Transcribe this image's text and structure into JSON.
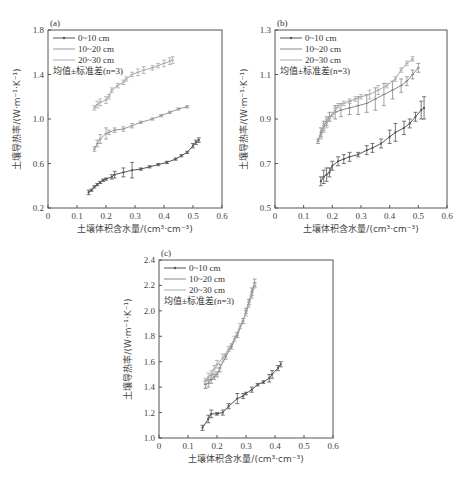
{
  "chart_data": [
    {
      "panel": "(a)",
      "type": "line",
      "title": "",
      "xlabel": "土壤体积含水量/(cm³·cm⁻³)",
      "ylabel": "土壤导热率/(W·m⁻¹·K⁻¹)",
      "xlim": [
        0,
        0.6
      ],
      "ylim": [
        0.2,
        1.8
      ],
      "xticks": [
        "0",
        "0.1",
        "0.2",
        "0.3",
        "0.4",
        "0.5",
        "0.6"
      ],
      "yticks": [
        "0.2",
        "0.6",
        "1.0",
        "1.4",
        "1.8"
      ],
      "legend": [
        "0~10 cm",
        "10~20 cm",
        "20~30 cm",
        "均值±标准差(n=3)"
      ],
      "legend_position": "upper left",
      "grid": false,
      "series": [
        {
          "name": "0~10 cm",
          "color": "#555555",
          "marker": "dot",
          "x": [
            0.14,
            0.15,
            0.16,
            0.17,
            0.18,
            0.19,
            0.2,
            0.22,
            0.23,
            0.26,
            0.29,
            0.32,
            0.35,
            0.38,
            0.41,
            0.44,
            0.46,
            0.48,
            0.5,
            0.51,
            0.52
          ],
          "y": [
            0.34,
            0.36,
            0.39,
            0.41,
            0.43,
            0.45,
            0.46,
            0.48,
            0.5,
            0.52,
            0.54,
            0.55,
            0.57,
            0.59,
            0.61,
            0.64,
            0.67,
            0.7,
            0.76,
            0.79,
            0.81
          ],
          "err": [
            0.02,
            0.01,
            0.01,
            0.01,
            0.01,
            0.01,
            0.01,
            0.02,
            0.03,
            0.04,
            0.07,
            0.01,
            0.01,
            0.01,
            0.01,
            0.01,
            0.01,
            0.01,
            0.02,
            0.02,
            0.02
          ]
        },
        {
          "name": "10~20 cm",
          "color": "#999999",
          "marker": "tick",
          "x": [
            0.16,
            0.17,
            0.18,
            0.2,
            0.21,
            0.23,
            0.26,
            0.29,
            0.32,
            0.36,
            0.39,
            0.42,
            0.45,
            0.48
          ],
          "y": [
            0.73,
            0.78,
            0.82,
            0.87,
            0.88,
            0.9,
            0.91,
            0.94,
            0.97,
            1.0,
            1.03,
            1.06,
            1.09,
            1.11
          ],
          "err": [
            0.02,
            0.03,
            0.04,
            0.05,
            0.02,
            0.02,
            0.02,
            0.02,
            0.01,
            0.01,
            0.01,
            0.01,
            0.01,
            0.01
          ]
        },
        {
          "name": "20~30 cm",
          "color": "#aaaaaa",
          "marker": "tick",
          "x": [
            0.16,
            0.17,
            0.18,
            0.2,
            0.21,
            0.22,
            0.24,
            0.26,
            0.27,
            0.29,
            0.31,
            0.33,
            0.36,
            0.38,
            0.4,
            0.42,
            0.43
          ],
          "y": [
            1.1,
            1.13,
            1.15,
            1.17,
            1.2,
            1.26,
            1.3,
            1.33,
            1.36,
            1.4,
            1.42,
            1.44,
            1.46,
            1.48,
            1.5,
            1.52,
            1.53
          ],
          "err": [
            0.02,
            0.03,
            0.03,
            0.03,
            0.02,
            0.02,
            0.02,
            0.02,
            0.02,
            0.02,
            0.03,
            0.03,
            0.02,
            0.02,
            0.03,
            0.03,
            0.03
          ]
        }
      ]
    },
    {
      "panel": "(b)",
      "type": "line",
      "title": "",
      "xlabel": "土壤体积含水量/(cm³·cm⁻³)",
      "ylabel": "土壤导热率/(W·m⁻¹·K⁻¹)",
      "xlim": [
        0,
        0.6
      ],
      "ylim": [
        0.5,
        1.3
      ],
      "xticks": [
        "0",
        "0.1",
        "0.2",
        "0.3",
        "0.4",
        "0.5",
        "0.6"
      ],
      "yticks": [
        "0.5",
        "0.7",
        "0.9",
        "1.1",
        "1.3"
      ],
      "legend": [
        "0~10 cm",
        "10~20 cm",
        "20~30 cm",
        "均值±标准差(n=3)"
      ],
      "legend_position": "upper left",
      "grid": false,
      "series": [
        {
          "name": "0~10 cm",
          "color": "#555555",
          "marker": "dot",
          "x": [
            0.16,
            0.17,
            0.18,
            0.19,
            0.2,
            0.22,
            0.24,
            0.26,
            0.29,
            0.32,
            0.34,
            0.37,
            0.4,
            0.42,
            0.45,
            0.47,
            0.49,
            0.51,
            0.52
          ],
          "y": [
            0.62,
            0.64,
            0.65,
            0.66,
            0.69,
            0.71,
            0.72,
            0.73,
            0.74,
            0.76,
            0.77,
            0.79,
            0.82,
            0.84,
            0.86,
            0.88,
            0.91,
            0.94,
            0.95
          ],
          "err": [
            0.02,
            0.03,
            0.03,
            0.02,
            0.02,
            0.02,
            0.02,
            0.02,
            0.01,
            0.02,
            0.02,
            0.02,
            0.03,
            0.04,
            0.03,
            0.02,
            0.02,
            0.04,
            0.05
          ]
        },
        {
          "name": "10~20 cm",
          "color": "#888888",
          "marker": "tick",
          "x": [
            0.15,
            0.16,
            0.17,
            0.18,
            0.19,
            0.21,
            0.23,
            0.26,
            0.29,
            0.32,
            0.35,
            0.38,
            0.41,
            0.44,
            0.46,
            0.48,
            0.5
          ],
          "y": [
            0.8,
            0.84,
            0.87,
            0.89,
            0.91,
            0.93,
            0.94,
            0.95,
            0.96,
            0.97,
            0.99,
            1.01,
            1.03,
            1.05,
            1.07,
            1.1,
            1.13
          ],
          "err": [
            0.01,
            0.02,
            0.02,
            0.02,
            0.02,
            0.03,
            0.03,
            0.03,
            0.04,
            0.04,
            0.05,
            0.05,
            0.04,
            0.03,
            0.02,
            0.02,
            0.02
          ]
        },
        {
          "name": "20~30 cm",
          "color": "#aaaaaa",
          "marker": "tick",
          "x": [
            0.16,
            0.17,
            0.18,
            0.19,
            0.2,
            0.21,
            0.22,
            0.24,
            0.26,
            0.28,
            0.3,
            0.33,
            0.36,
            0.39,
            0.42,
            0.44,
            0.46,
            0.48
          ],
          "y": [
            0.82,
            0.86,
            0.88,
            0.9,
            0.92,
            0.94,
            0.96,
            0.97,
            0.98,
            0.99,
            1.0,
            1.01,
            1.03,
            1.05,
            1.08,
            1.12,
            1.15,
            1.17
          ],
          "err": [
            0.01,
            0.02,
            0.02,
            0.01,
            0.01,
            0.01,
            0.01,
            0.01,
            0.01,
            0.01,
            0.01,
            0.02,
            0.02,
            0.01,
            0.01,
            0.01,
            0.01,
            0.01
          ]
        }
      ]
    },
    {
      "panel": "(c)",
      "type": "line",
      "title": "",
      "xlabel": "土壤体积含水量/(cm³·cm⁻³)",
      "ylabel": "土壤导热率/(W·m⁻¹·K⁻¹)",
      "xlim": [
        0,
        0.6
      ],
      "ylim": [
        1.0,
        2.4
      ],
      "xticks": [
        "0",
        "0.1",
        "0.2",
        "0.3",
        "0.4",
        "0.5",
        "0.6"
      ],
      "yticks": [
        "1.0",
        "1.2",
        "1.4",
        "1.6",
        "1.8",
        "2.0",
        "2.2",
        "2.4"
      ],
      "legend": [
        "0~10 cm",
        "10~20 cm",
        "20~30 cm",
        "均值±标准差(n=3)"
      ],
      "legend_position": "upper left",
      "grid": false,
      "series": [
        {
          "name": "0~10 cm",
          "color": "#555555",
          "marker": "dot",
          "x": [
            0.15,
            0.17,
            0.18,
            0.2,
            0.22,
            0.24,
            0.27,
            0.29,
            0.3,
            0.32,
            0.34,
            0.36,
            0.38,
            0.39,
            0.41,
            0.42
          ],
          "y": [
            1.08,
            1.15,
            1.19,
            1.19,
            1.2,
            1.25,
            1.31,
            1.33,
            1.35,
            1.38,
            1.42,
            1.44,
            1.47,
            1.5,
            1.55,
            1.58
          ],
          "err": [
            0.02,
            0.03,
            0.03,
            0.01,
            0.02,
            0.02,
            0.04,
            0.02,
            0.01,
            0.02,
            0.01,
            0.01,
            0.03,
            0.03,
            0.02,
            0.02
          ]
        },
        {
          "name": "10~20 cm",
          "color": "#888888",
          "marker": "tick",
          "x": [
            0.16,
            0.17,
            0.18,
            0.19,
            0.2,
            0.21,
            0.23,
            0.25,
            0.27,
            0.29,
            0.3,
            0.31,
            0.32,
            0.33
          ],
          "y": [
            1.42,
            1.43,
            1.46,
            1.48,
            1.5,
            1.55,
            1.64,
            1.72,
            1.81,
            1.92,
            2.0,
            2.07,
            2.15,
            2.22
          ],
          "err": [
            0.03,
            0.03,
            0.03,
            0.02,
            0.02,
            0.03,
            0.02,
            0.02,
            0.02,
            0.02,
            0.02,
            0.02,
            0.03,
            0.03
          ]
        },
        {
          "name": "20~30 cm",
          "color": "#aaaaaa",
          "marker": "tick",
          "x": [
            0.16,
            0.17,
            0.18,
            0.19,
            0.2,
            0.22,
            0.24,
            0.26,
            0.28,
            0.3,
            0.31,
            0.32,
            0.33
          ],
          "y": [
            1.45,
            1.48,
            1.5,
            1.54,
            1.58,
            1.63,
            1.7,
            1.78,
            1.88,
            1.98,
            2.05,
            2.12,
            2.2
          ],
          "err": [
            0.02,
            0.03,
            0.03,
            0.03,
            0.03,
            0.03,
            0.02,
            0.02,
            0.02,
            0.02,
            0.02,
            0.02,
            0.02
          ]
        }
      ]
    }
  ],
  "panels": [
    {
      "label": "(a)",
      "box": [
        48,
        30,
        222,
        208
      ]
    },
    {
      "label": "(b)",
      "box": [
        275,
        30,
        447,
        208
      ]
    },
    {
      "label": "(c)",
      "box": [
        159,
        260,
        333,
        438
      ]
    }
  ]
}
